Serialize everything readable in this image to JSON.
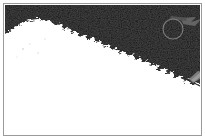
{
  "panel": {
    "title": "Binary threshold image",
    "border_color": "#9a9a9a",
    "background_color": "#ffffff"
  },
  "image": {
    "name": "thresholded-scene",
    "description": "High-contrast binary image: white foreground mass occupying the lower-left with a rough jagged diagonal boundary against a black upper-right region",
    "width_px": 195,
    "height_px": 129,
    "foreground_color": "#ffffff",
    "background_color": "#050505",
    "noise_color": "#2a2a2a",
    "boundary_label": "jagged diagonal edge",
    "boundary_points": "0,30 6,25 12,21 18,18 24,16 30,15 36,16 42,19 46,17 52,22 56,20 60,26 64,24 68,30 72,28 76,33 80,31 84,36 88,34 92,39 96,37 100,43 104,41 108,46 112,44 116,50 120,48 124,53 128,51 132,56 136,54 140,60 144,58 148,63 152,61 156,67 160,65 164,70 168,68 172,74 176,72 180,78 184,76 188,82 192,80 195,86"
  },
  "annotations": {
    "circle": {
      "name": "circle-marker",
      "label": "circle annotation",
      "center_x": 168,
      "center_y": 24,
      "radius": 10,
      "stroke_color": "#7e7e7e"
    },
    "arrow": {
      "name": "arrow-marker",
      "label": "arrow pointing right",
      "color": "#6d6d6d"
    },
    "blob": {
      "name": "blob-marker",
      "label": "small gray blob",
      "color": "#868686"
    },
    "streak": {
      "name": "streak-marker",
      "label": "faint gray streak",
      "color": "#4a4a4a"
    }
  }
}
